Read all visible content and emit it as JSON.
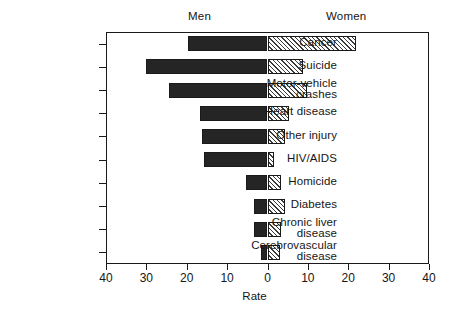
{
  "header": {
    "men_label": "Men",
    "women_label": "Women"
  },
  "axis": {
    "x_title": "Rate",
    "x_ticks": [
      "40",
      "30",
      "20",
      "10",
      "0",
      "10",
      "20",
      "30",
      "40"
    ]
  },
  "categories": [
    "Cancer",
    "Suicide",
    "Motor-vehicle\ncrashes",
    "Heart disease",
    "Other injury",
    "HIV/AIDS",
    "Homicide",
    "Diabetes",
    "Chronic liver\ndisease",
    "Cerebrovascular\ndisease"
  ],
  "colors": {
    "men_fill": "#252525",
    "women_fill": "#ffffff",
    "women_hatch": "#3a3a3a",
    "frame": "#1a1a1a",
    "text": "#161616",
    "background": "#ffffff"
  },
  "chart_data": {
    "type": "bar",
    "orientation": "horizontal",
    "style": "population-pyramid",
    "title": "",
    "subtitle": "",
    "xlabel": "Rate",
    "ylabel": "",
    "xlim": [
      -40,
      40
    ],
    "x_tick_values": [
      -40,
      -30,
      -20,
      -10,
      0,
      10,
      20,
      30,
      40
    ],
    "x_tick_labels": [
      "40",
      "30",
      "20",
      "10",
      "0",
      "10",
      "20",
      "30",
      "40"
    ],
    "grid": false,
    "legend": [
      "Men",
      "Women"
    ],
    "legend_position": "top",
    "categories": [
      "Cancer",
      "Suicide",
      "Motor-vehicle crashes",
      "Heart disease",
      "Other injury",
      "HIV/AIDS",
      "Homicide",
      "Diabetes",
      "Chronic liver disease",
      "Cerebrovascular disease"
    ],
    "series": [
      {
        "name": "Men",
        "direction": "left",
        "values": [
          19.8,
          30.2,
          24.3,
          16.6,
          16.1,
          15.8,
          5.4,
          3.4,
          3.4,
          1.5
        ]
      },
      {
        "name": "Women",
        "direction": "right",
        "values": [
          21.8,
          8.7,
          9.9,
          5.4,
          4.4,
          1.5,
          3.4,
          4.4,
          3.4,
          3.2
        ]
      }
    ]
  }
}
